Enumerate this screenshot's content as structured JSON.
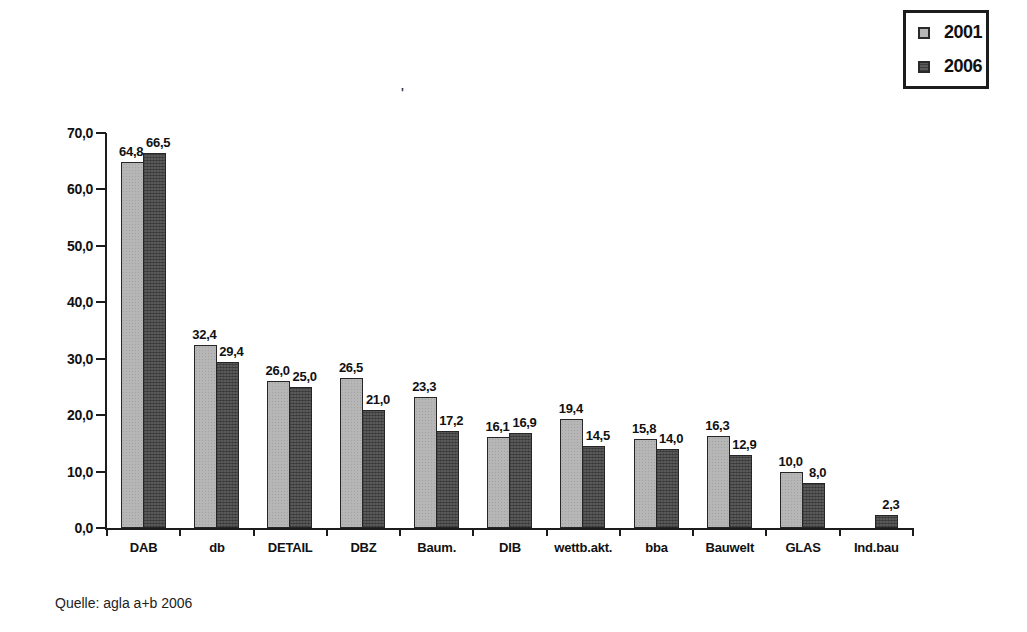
{
  "legend": {
    "items": [
      {
        "label": "2001",
        "color": "#b6b6b6"
      },
      {
        "label": "2006",
        "color": "#585858"
      }
    ]
  },
  "source": "Quelle: agla a+b 2006",
  "stray_mark": "'",
  "colors": {
    "series_2001": "#b6b6b6",
    "series_2006": "#585858",
    "axis": "#1c1c1c",
    "background": "#ffffff"
  },
  "chart_data": {
    "type": "bar",
    "title": "",
    "xlabel": "",
    "ylabel": "",
    "categories": [
      "DAB",
      "db",
      "DETAIL",
      "DBZ",
      "Baum.",
      "DIB",
      "wettb.akt.",
      "bba",
      "Bauwelt",
      "GLAS",
      "Ind.bau"
    ],
    "series": [
      {
        "name": "2001",
        "values": [
          64.8,
          32.4,
          26.0,
          26.5,
          23.3,
          16.1,
          19.4,
          15.8,
          16.3,
          10.0,
          null
        ]
      },
      {
        "name": "2006",
        "values": [
          66.5,
          29.4,
          25.0,
          21.0,
          17.2,
          16.9,
          14.5,
          14.0,
          12.9,
          8.0,
          2.3
        ]
      }
    ],
    "ylim": [
      0,
      70
    ],
    "ytick_step": 10,
    "decimal_separator": ",",
    "value_labels": true,
    "grid": false,
    "legend_position": "top-right"
  }
}
